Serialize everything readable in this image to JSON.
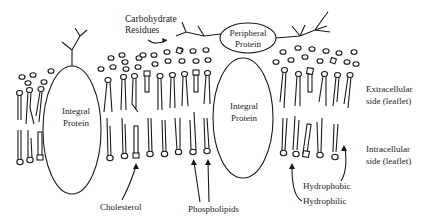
{
  "diagram": {
    "type": "cell-membrane-fluid-mosaic",
    "labels": {
      "carbohydrate_line1": "Carbohydrate",
      "carbohydrate_line2": "Residues",
      "peripheral_line1": "Peripheral",
      "peripheral_line2": "Protein",
      "integral_left_line1": "Integral",
      "integral_left_line2": "Protein",
      "integral_right_line1": "Integral",
      "integral_right_line2": "Protein",
      "extracellular_line1": "Extracellular",
      "extracellular_line2": "side (leaflet)",
      "intracellular_line1": "Intracellular",
      "intracellular_line2": "side (leaflet)",
      "cholesterol": "Cholesterol",
      "phospholipids": "Phospholipids",
      "hydrophobic": "Hydrophobic",
      "hydrophilic": "Hydrophilic"
    },
    "colors": {
      "ink": "#1a1a1a",
      "background": "#ffffff"
    }
  }
}
